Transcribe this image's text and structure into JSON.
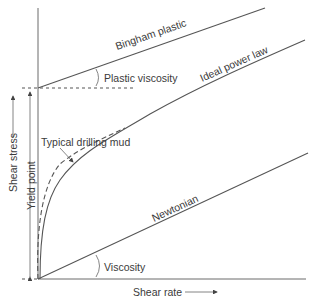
{
  "diagram": {
    "labels": {
      "bingham": "Bingham plastic",
      "plastic_viscosity": "Plastic viscosity",
      "power_law": "Ideal power law",
      "drilling_mud": "Typical drilling mud",
      "newtonian": "Newtonian",
      "viscosity": "Viscosity",
      "yield_point": "Yield point",
      "y_axis": "Shear stress",
      "x_axis": "Shear rate"
    },
    "colors": {
      "line": "#555555",
      "axis": "#6a6a6a",
      "text": "#3a3a3a"
    }
  }
}
